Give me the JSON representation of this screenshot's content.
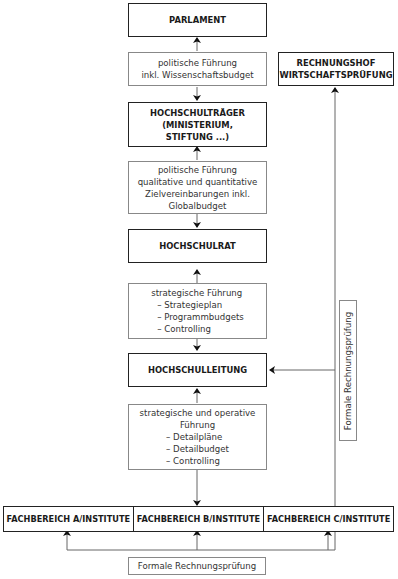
{
  "diagram": {
    "parlament": "PARLAMENT",
    "link1": [
      "politische Führung",
      "inkl. Wissenschaftsbudget"
    ],
    "traeger": [
      "HOCHSCHULTRÄGER",
      "(MINISTERIUM,",
      "STIFTUNG ...)"
    ],
    "link2": [
      "politische Führung",
      "qualitative und quantitative",
      "Zielvereinbarungen inkl.",
      "Globalbudget"
    ],
    "hochschulrat": "HOCHSCHULRAT",
    "link3": {
      "title": "strategische Führung",
      "items": [
        "– Strategieplan",
        "– Programmbudgets",
        "– Controlling"
      ]
    },
    "leitung": "HOCHSCHULLEITUNG",
    "link4": {
      "title": [
        "strategische und operative",
        "Führung"
      ],
      "items": [
        "– Detailpläne",
        "– Detailbudget",
        "– Controlling"
      ]
    },
    "fachbereiche": [
      "FACHBEREICH A/INSTITUTE",
      "FACHBEREICH B/INSTITUTE",
      "FACHBEREICH C/INSTITUTE"
    ],
    "rechnungshof": [
      "RECHNUNGSHOF",
      "WIRTSCHAFTSPRÜFUNG"
    ],
    "pruefung_vertical": "Formale Rechnungsprüfung",
    "pruefung_bottom": "Formale Rechnungsprüfung"
  },
  "colors": {
    "line": "#666666",
    "main_border": "#222222",
    "sub_border": "#888888"
  }
}
